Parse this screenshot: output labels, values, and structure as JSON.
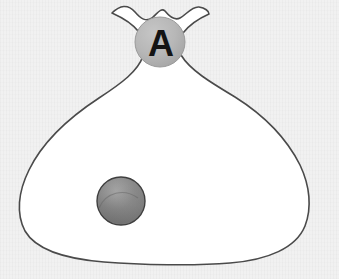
{
  "scene": {
    "title": "Bag A containing one ball",
    "background_color": "#f1f1f1",
    "canvas": {
      "width": 339,
      "height": 279
    }
  },
  "bag": {
    "name": "cloth-bag",
    "fill_color": "#ffffff",
    "outline_color": "#4a4a4a",
    "outline_width": 1.6,
    "description": "white cloth sack with scalloped open top, cinched neck and wide rounded base",
    "bounds": {
      "left": 20,
      "right": 311,
      "top": 3,
      "bottom": 263
    }
  },
  "tie": {
    "name": "bag-tie",
    "label": "A",
    "fill_color": "#b5b5b5",
    "rim_color": "#9a9a9a",
    "text_color": "#141414",
    "center": {
      "x": 160,
      "y": 42
    },
    "radius": 25
  },
  "ball": {
    "name": "ball-inside-bag",
    "fill_color": "#7f7f7f",
    "highlight_color": "#a2a2a2",
    "shade_color": "#6b6b6b",
    "outline_color": "#3f3f3f",
    "center": {
      "x": 121,
      "y": 201
    },
    "radius": 24,
    "count": 1
  }
}
